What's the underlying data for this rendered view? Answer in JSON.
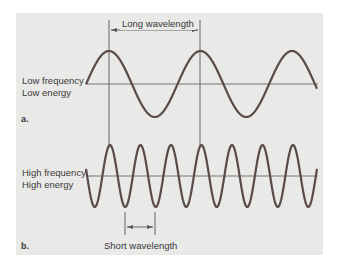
{
  "diagram": {
    "colors": {
      "background": "#ffffff",
      "panel": "#e9e9e7",
      "wave": "#5a4a4a",
      "lines": "#555555",
      "text": "#3a3a3a"
    },
    "panel_a": {
      "tag": "a.",
      "label_line1": "Low frequency",
      "label_line2": "Low energy",
      "measure_label": "Long wavelength",
      "cycles_shown": 2.5
    },
    "panel_b": {
      "tag": "b.",
      "label_line1": "High frequency",
      "label_line2": "High energy",
      "measure_label": "Short wavelength",
      "cycles_shown": 7.5
    }
  }
}
